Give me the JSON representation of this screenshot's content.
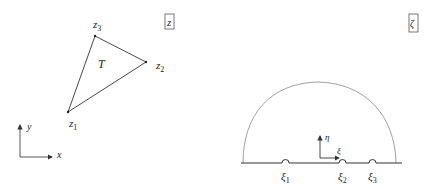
{
  "z_plane": {
    "box_label": "z",
    "region_label": "T",
    "vertices": [
      {
        "name": "z1",
        "base": "z",
        "sub": "1"
      },
      {
        "name": "z2",
        "base": "z",
        "sub": "2"
      },
      {
        "name": "z3",
        "base": "z",
        "sub": "3"
      }
    ],
    "axes": {
      "x": "x",
      "y": "y"
    }
  },
  "zeta_plane": {
    "box_label": "ζ",
    "axes": {
      "xi": "ξ",
      "eta": "η"
    },
    "points": [
      {
        "base": "ξ",
        "sub": "1"
      },
      {
        "base": "ξ",
        "sub": "2"
      },
      {
        "base": "ξ",
        "sub": "3"
      }
    ]
  }
}
